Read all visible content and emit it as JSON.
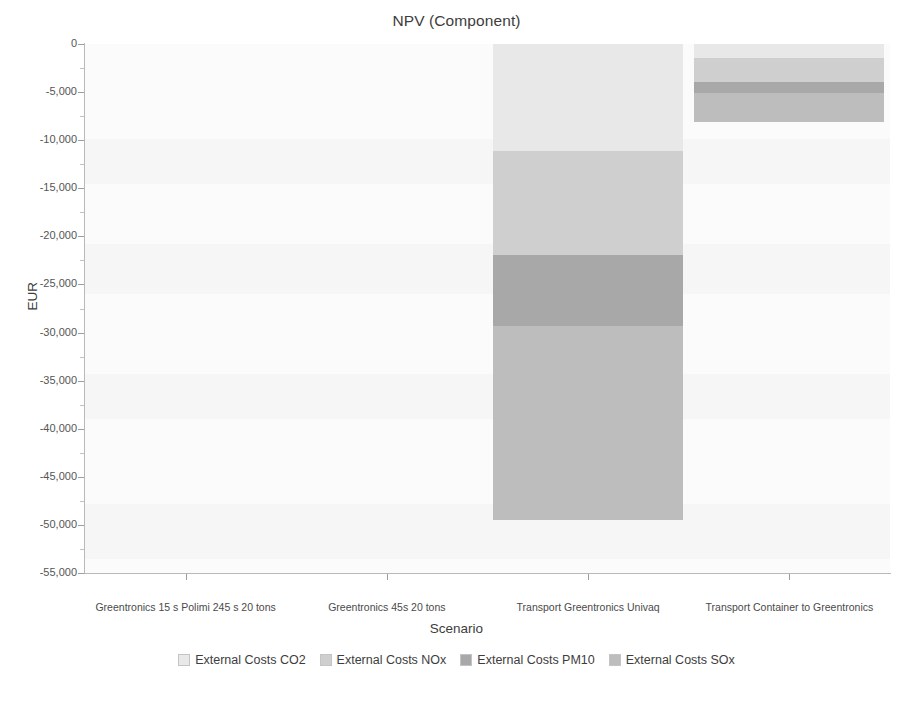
{
  "chart_data": {
    "type": "bar",
    "stacked": true,
    "orientation": "vertical",
    "title": "NPV (Component)",
    "xlabel": "Scenario",
    "ylabel": "EUR",
    "ylim": [
      -55000,
      0
    ],
    "ytick_step": 5000,
    "grid": false,
    "legend_position": "bottom",
    "categories": [
      "Greentronics 15 s Polimi 245 s 20 tons",
      "Greentronics 45s 20 tons",
      "Transport Greentronics Univaq",
      "Transport Container to Greentronics"
    ],
    "ytick_labels": [
      "0",
      "-5,000",
      "-10,000",
      "-15,000",
      "-20,000",
      "-25,000",
      "-30,000",
      "-35,000",
      "-40,000",
      "-45,000",
      "-50,000",
      "-55,000"
    ],
    "ytick_values": [
      0,
      -5000,
      -10000,
      -15000,
      -20000,
      -25000,
      -30000,
      -35000,
      -40000,
      -45000,
      -50000,
      -55000
    ],
    "series": [
      {
        "name": "External Costs CO2",
        "color": "#e8e8e8",
        "values": [
          0,
          0,
          -11100,
          -1500
        ]
      },
      {
        "name": "External Costs NOx",
        "color": "#cfcfcf",
        "values": [
          0,
          0,
          -10800,
          -2400
        ]
      },
      {
        "name": "External Costs PM10",
        "color": "#a8a8a8",
        "values": [
          0,
          0,
          -7400,
          -1200
        ]
      },
      {
        "name": "External Costs SOx",
        "color": "#bdbdbd",
        "values": [
          0,
          0,
          -20200,
          -3000
        ]
      }
    ],
    "totals": [
      0,
      0,
      -49500,
      -8100
    ]
  }
}
